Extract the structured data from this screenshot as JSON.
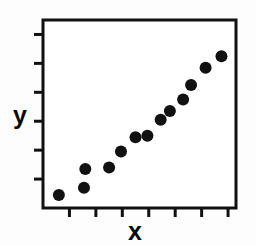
{
  "chart_data": {
    "type": "scatter",
    "title": "",
    "xlabel": "x",
    "ylabel": "y",
    "xlim": [
      0,
      7.3
    ],
    "ylim": [
      0,
      6.5
    ],
    "grid": false,
    "legend": null,
    "marker": {
      "shape": "circle",
      "color": "#111111",
      "size": 9
    },
    "axis": {
      "frame_color": "#111111",
      "frame_width": 3,
      "tick_color": "#111111",
      "tick_length": 9,
      "tick_direction": "out",
      "x_tick_count": 7,
      "y_tick_count": 6,
      "x_tick_values": [
        1,
        2,
        3,
        4,
        5,
        6,
        7
      ],
      "y_tick_values": [
        1,
        2,
        3,
        4,
        5,
        6
      ],
      "x_tick_labels": [
        "",
        "",
        "",
        "",
        "",
        "",
        ""
      ],
      "y_tick_labels": [
        "",
        "",
        "",
        "",
        "",
        ""
      ]
    },
    "points": [
      {
        "x": 0.6,
        "y": 0.45
      },
      {
        "x": 1.55,
        "y": 0.7
      },
      {
        "x": 1.6,
        "y": 1.35
      },
      {
        "x": 2.5,
        "y": 1.4
      },
      {
        "x": 2.95,
        "y": 1.95
      },
      {
        "x": 3.5,
        "y": 2.45
      },
      {
        "x": 3.95,
        "y": 2.5
      },
      {
        "x": 4.45,
        "y": 3.05
      },
      {
        "x": 4.8,
        "y": 3.35
      },
      {
        "x": 5.3,
        "y": 3.75
      },
      {
        "x": 5.6,
        "y": 4.25
      },
      {
        "x": 6.15,
        "y": 4.85
      },
      {
        "x": 6.75,
        "y": 5.25
      }
    ],
    "series": [
      {
        "name": "data",
        "x": [
          0.6,
          1.55,
          1.6,
          2.5,
          2.95,
          3.5,
          3.95,
          4.45,
          4.8,
          5.3,
          5.6,
          6.15,
          6.75
        ],
        "y": [
          0.45,
          0.7,
          1.35,
          1.4,
          1.95,
          2.45,
          2.5,
          3.05,
          3.35,
          3.75,
          4.25,
          4.85,
          5.25
        ]
      }
    ]
  },
  "figure": {
    "background": "#fdfdfd",
    "plot_background": "#ffffff"
  }
}
